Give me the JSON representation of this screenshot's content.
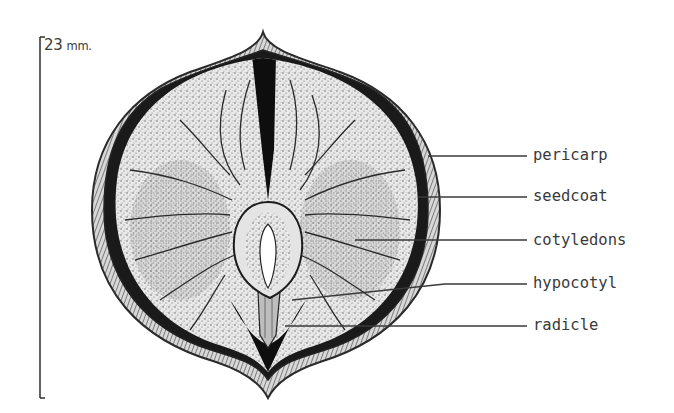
{
  "figure": {
    "type": "botanical cross-section illustration",
    "scale_bar": {
      "value": "23",
      "unit": "mm."
    },
    "labels": [
      {
        "id": "pericarp",
        "text": "pericarp",
        "y": 155,
        "line_from_x": 428,
        "line_from_y": 156
      },
      {
        "id": "seedcoat",
        "text": "seedcoat",
        "y": 196,
        "line_from_x": 418,
        "line_from_y": 197
      },
      {
        "id": "cotyledons",
        "text": "cotyledons",
        "y": 240,
        "line_from_x": 355,
        "line_from_y": 240
      },
      {
        "id": "hypocotyl",
        "text": "hypocotyl",
        "y": 283,
        "line_from_x": 292,
        "line_from_y": 300
      },
      {
        "id": "radicle",
        "text": "radicle",
        "y": 325,
        "line_from_x": 285,
        "line_from_y": 326
      }
    ],
    "colors": {
      "ink": "#2a2a2a",
      "label_text": "#3a3a3a",
      "dark_fill": "#111111",
      "background": "#ffffff"
    }
  }
}
